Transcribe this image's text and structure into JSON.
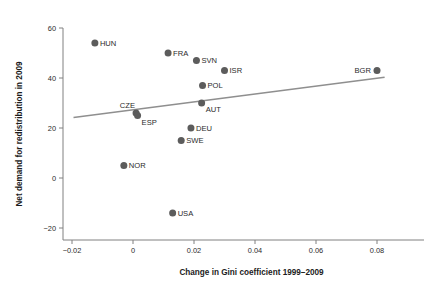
{
  "chart_data": {
    "type": "scatter",
    "title": "",
    "subtitle": "",
    "xlabel": "Change in Gini coefficient 1999–2009",
    "ylabel": "Net demand for redistribution in 2009",
    "xlim": [
      -0.0245,
      0.0845
    ],
    "ylim": [
      -24,
      62
    ],
    "xticks": [
      -0.02,
      0,
      0.02,
      0.04,
      0.06,
      0.08
    ],
    "xtick_labels": [
      "−0.02",
      "0",
      "0.02",
      "0.04",
      "0.06",
      "0.08"
    ],
    "yticks": [
      -20,
      0,
      20,
      40,
      60
    ],
    "ytick_labels": [
      "−20",
      "0",
      "20",
      "40",
      "60"
    ],
    "grid": false,
    "legend": false,
    "legend_position": "none",
    "marker_color": "#5c5c5c",
    "line_color": "#8f8f8f",
    "axis_color": "#808080",
    "points": [
      {
        "label": "HUN",
        "x": -0.0125,
        "y": 54,
        "label_pos": "right"
      },
      {
        "label": "NOR",
        "x": -0.003,
        "y": 5,
        "label_pos": "right"
      },
      {
        "label": "CZE",
        "x": 0.001,
        "y": 26,
        "label_pos": "above-left"
      },
      {
        "label": "ESP",
        "x": 0.0015,
        "y": 25,
        "label_pos": "below-right"
      },
      {
        "label": "FRA",
        "x": 0.0115,
        "y": 50,
        "label_pos": "right"
      },
      {
        "label": "USA",
        "x": 0.013,
        "y": -14,
        "label_pos": "right"
      },
      {
        "label": "SWE",
        "x": 0.0158,
        "y": 15,
        "label_pos": "right"
      },
      {
        "label": "DEU",
        "x": 0.019,
        "y": 20,
        "label_pos": "right"
      },
      {
        "label": "SVN",
        "x": 0.0208,
        "y": 47,
        "label_pos": "right"
      },
      {
        "label": "AUT",
        "x": 0.0225,
        "y": 30,
        "label_pos": "below-right"
      },
      {
        "label": "POL",
        "x": 0.0228,
        "y": 37,
        "label_pos": "right"
      },
      {
        "label": "ISR",
        "x": 0.03,
        "y": 43,
        "label_pos": "right"
      },
      {
        "label": "BGR",
        "x": 0.08,
        "y": 43,
        "label_pos": "left"
      }
    ],
    "fit_line": {
      "x_start": -0.0195,
      "y_start": 24.2,
      "x_end": 0.0825,
      "y_end": 40.3
    },
    "annotations": []
  }
}
